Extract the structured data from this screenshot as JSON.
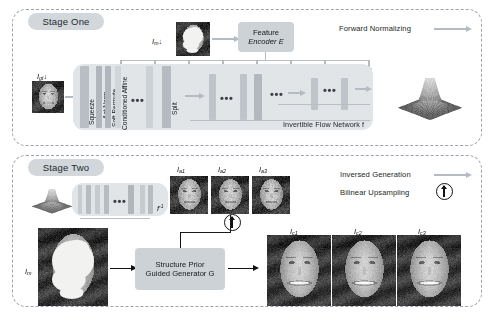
{
  "figure": {
    "type": "architecture-diagram",
    "stages": [
      {
        "id": "stage-one",
        "badge": "Stage One",
        "legend": [
          {
            "label": "Forward Normalizing",
            "icon": "gray-right-arrow"
          }
        ],
        "network_label": "Invertible Flow Network  f",
        "inputs": [
          {
            "name": "mask-input",
            "label": "I",
            "sub": "m",
            "arrow": "↓"
          },
          {
            "name": "ground-truth-input",
            "label": "I",
            "sub": "gt",
            "arrow": "↓"
          }
        ],
        "encoder_box": "Feature\nEncoder E",
        "encoder_line1": "Feature",
        "encoder_line2": "Encoder E",
        "flow_layers": [
          "Squeeze",
          "Act Norm",
          "Soft Permute",
          "Conditioned Affine",
          "Split"
        ],
        "ellipsis": "•••",
        "output": "gaussian-surface-plot"
      },
      {
        "id": "stage-two",
        "badge": "Stage Two",
        "legend": [
          {
            "label": "Inversed Generation",
            "icon": "gray-right-arrow"
          },
          {
            "label": "Bilinear Upsampling",
            "icon": "up-arrow-circle"
          }
        ],
        "inverse_flow_label": "f",
        "inverse_flow_sup": "-1",
        "generator_line1": "Structure Prior",
        "generator_line2": "Guided Generator G",
        "masked_input": {
          "label": "I",
          "sub": "m"
        },
        "priors": [
          {
            "label": "I",
            "sub": "a1"
          },
          {
            "label": "I",
            "sub": "a2"
          },
          {
            "label": "I",
            "sub": "a3"
          }
        ],
        "results": [
          {
            "label": "I",
            "sub": "c1"
          },
          {
            "label": "I",
            "sub": "c2"
          },
          {
            "label": "I",
            "sub": "c3"
          }
        ],
        "ellipsis": "•••"
      }
    ],
    "colors": {
      "badge_bg": "#d2d7dc",
      "dashed_border": "#9aa3ad",
      "flow_bg": "#e2e5e8",
      "box_bg": "#cdd2d7",
      "gray_arrow": "#b5bbc1",
      "black_arrow": "#111111",
      "band_dark": "#b0b6bc",
      "band_light": "#d7dbdf"
    }
  }
}
